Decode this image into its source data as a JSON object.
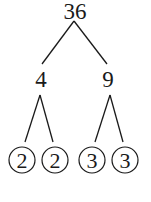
{
  "diagram": {
    "type": "factor-tree",
    "root": {
      "value": "36",
      "x": 75,
      "y": 19
    },
    "level1": [
      {
        "value": "4",
        "x": 41,
        "y": 87
      },
      {
        "value": "9",
        "x": 108,
        "y": 87
      }
    ],
    "leaves": [
      {
        "value": "2",
        "x": 22,
        "y": 160,
        "circled": true
      },
      {
        "value": "2",
        "x": 55,
        "y": 160,
        "circled": true
      },
      {
        "value": "3",
        "x": 92,
        "y": 160,
        "circled": true
      },
      {
        "value": "3",
        "x": 125,
        "y": 160,
        "circled": true
      }
    ],
    "line_color": "#1a1a1a"
  }
}
